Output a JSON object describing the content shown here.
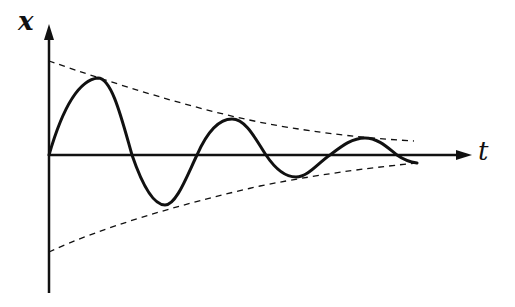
{
  "diagram": {
    "axes": {
      "vertical_label": "x",
      "horizontal_label": "t"
    },
    "elements": [
      {
        "name": "damped-oscillation-curve",
        "style": "solid"
      },
      {
        "name": "upper-envelope",
        "style": "dashed"
      },
      {
        "name": "lower-envelope",
        "style": "dashed"
      }
    ],
    "colors": {
      "ink": "#111111",
      "background": "#ffffff"
    }
  }
}
